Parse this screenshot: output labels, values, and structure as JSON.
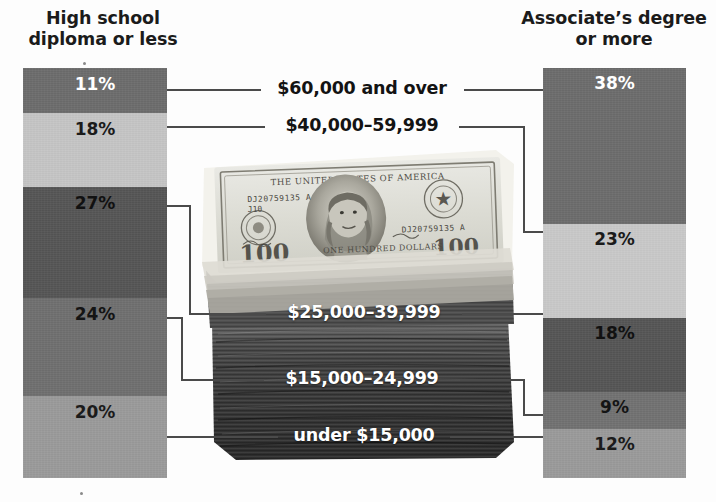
{
  "chart_data": {
    "type": "bar",
    "title": "",
    "subtitle": "",
    "xlabel": "",
    "ylabel": "",
    "orientation": "stacked-vertical",
    "legend_position": "none",
    "grid": false,
    "categories": [
      "$60,000 and over",
      "$40,000-59,999",
      "$25,000-39,999",
      "$15,000-24,999",
      "under $15,000"
    ],
    "series": [
      {
        "name": "High school diploma or less",
        "values": [
          11,
          18,
          27,
          24,
          20
        ],
        "value_labels": [
          "11%",
          "18%",
          "27%",
          "24%",
          "20%"
        ]
      },
      {
        "name": "Associate's degree or more",
        "values": [
          38,
          23,
          18,
          9,
          12
        ],
        "value_labels": [
          "38%",
          "23%",
          "18%",
          "9%",
          "12%"
        ]
      }
    ],
    "ylim": [
      0,
      100
    ],
    "units": "percent"
  },
  "headings": {
    "left": "High school diploma or less",
    "right": "Associate’s degree or more"
  },
  "left_column": {
    "name": "High school diploma or less",
    "segments": [
      {
        "label": "11%",
        "value": 11,
        "color": "#6c6c6c",
        "text_color": "#ffffff"
      },
      {
        "label": "18%",
        "value": 18,
        "color": "#c5c5c5",
        "text_color": "#1b1b1b"
      },
      {
        "label": "27%",
        "value": 27,
        "color": "#555555",
        "text_color": "#111111"
      },
      {
        "label": "24%",
        "value": 24,
        "color": "#6f6f6f",
        "text_color": "#141414"
      },
      {
        "label": "20%",
        "value": 20,
        "color": "#9a9a9a",
        "text_color": "#1b1b1b"
      }
    ]
  },
  "right_column": {
    "name": "Associate's degree or more",
    "segments": [
      {
        "label": "38%",
        "value": 38,
        "color": "#6c6c6c",
        "text_color": "#ffffff"
      },
      {
        "label": "23%",
        "value": 23,
        "color": "#c9c9c9",
        "text_color": "#1b1b1b"
      },
      {
        "label": "18%",
        "value": 18,
        "color": "#555555",
        "text_color": "#111111"
      },
      {
        "label": "9%",
        "value": 9,
        "color": "#717171",
        "text_color": "#141414"
      },
      {
        "label": "12%",
        "value": 12,
        "color": "#9a9a9a",
        "text_color": "#1b1b1b"
      }
    ]
  },
  "center_labels": [
    {
      "text": "$60,000 and over",
      "style": "dark"
    },
    {
      "text": "$40,000–59,999",
      "style": "dark"
    },
    {
      "text": "$25,000–39,999",
      "style": "light"
    },
    {
      "text": "$15,000–24,999",
      "style": "light"
    },
    {
      "text": "under $15,000",
      "style": "light"
    }
  ],
  "photo": {
    "name": "stack-of-hundred-dollar-bills",
    "bill_texts": {
      "top_line": "THE UNITED STATES OF AMERICA",
      "serial_left": "DJ20759135 A",
      "serial_left_sub": "J10",
      "serial_right": "DJ20759135 A",
      "denomination": "100",
      "bottom_line": "ONE HUNDRED DOLLARS"
    }
  },
  "colors": {
    "background": "#fdfdfd",
    "heading_text": "#1b1b1b",
    "connector_line": "#4a4a4a",
    "label_dark": "#131313",
    "label_light": "#ffffff"
  }
}
